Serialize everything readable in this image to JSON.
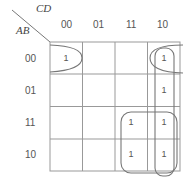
{
  "kmap": {
    "col_var": "CD",
    "row_var": "AB",
    "col_labels": [
      "00",
      "01",
      "11",
      "10"
    ],
    "row_labels": [
      "00",
      "01",
      "11",
      "10"
    ],
    "cells": [
      [
        "1",
        "",
        "",
        "1"
      ],
      [
        "",
        "",
        "",
        "1"
      ],
      [
        "",
        "",
        "1",
        "1"
      ],
      [
        "",
        "",
        "1",
        "1"
      ]
    ],
    "groupings": [
      {
        "name": "corners-wrap",
        "cells": [
          [
            0,
            0
          ],
          [
            0,
            3
          ]
        ]
      },
      {
        "name": "column-10",
        "cells": [
          [
            0,
            3
          ],
          [
            1,
            3
          ],
          [
            2,
            3
          ],
          [
            3,
            3
          ]
        ]
      },
      {
        "name": "square-bottom-right",
        "cells": [
          [
            2,
            2
          ],
          [
            2,
            3
          ],
          [
            3,
            2
          ],
          [
            3,
            3
          ]
        ]
      }
    ]
  }
}
